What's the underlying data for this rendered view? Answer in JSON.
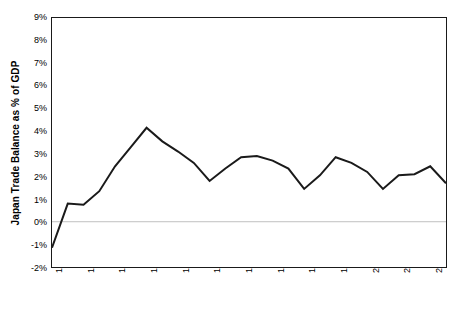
{
  "chart_data": {
    "type": "line",
    "title": "",
    "xlabel": "",
    "ylabel": "Japan Trade Balance as % of GDP",
    "x": [
      1980,
      1981,
      1982,
      1983,
      1984,
      1985,
      1986,
      1987,
      1988,
      1989,
      1990,
      1991,
      1992,
      1993,
      1994,
      1995,
      1996,
      1997,
      1998,
      1999,
      2000,
      2001,
      2002,
      2003,
      2004,
      2005
    ],
    "values": [
      -1.15,
      0.8,
      0.75,
      1.35,
      2.45,
      3.3,
      4.15,
      3.55,
      3.1,
      2.6,
      1.8,
      2.35,
      2.85,
      2.9,
      2.7,
      2.35,
      1.45,
      2.05,
      2.85,
      2.6,
      2.2,
      1.45,
      2.05,
      2.1,
      2.45,
      1.7
    ],
    "series": [
      {
        "name": "Japan Trade Balance as % of GDP",
        "values": [
          -1.15,
          0.8,
          0.75,
          1.35,
          2.45,
          3.3,
          4.15,
          3.55,
          3.1,
          2.6,
          1.8,
          2.35,
          2.85,
          2.9,
          2.7,
          2.35,
          1.45,
          2.05,
          2.85,
          2.6,
          2.2,
          1.45,
          2.05,
          2.1,
          2.45,
          1.7
        ],
        "color": "#1a1a1a"
      }
    ],
    "xlim": [
      1980,
      2005
    ],
    "ylim": [
      -2,
      9
    ],
    "y_ticks": [
      9,
      8,
      7,
      6,
      5,
      4,
      3,
      2,
      1,
      0,
      -1,
      -2
    ],
    "y_tick_labels": [
      "9%",
      "8%",
      "7%",
      "6%",
      "5%",
      "4%",
      "3%",
      "2%",
      "1%",
      "0%",
      "-1%",
      "-2%"
    ],
    "x_ticks": [
      1980,
      1982,
      1984,
      1986,
      1988,
      1990,
      1992,
      1994,
      1996,
      1998,
      2000,
      2002,
      2004
    ],
    "x_tick_labels": [
      "1980",
      "1982",
      "1984",
      "1986",
      "1988",
      "1990",
      "1992",
      "1994",
      "1996",
      "1998",
      "2000",
      "2002",
      "2004"
    ],
    "grid": false,
    "zero_line": true,
    "zero_line_color": "#bfbfbf",
    "legend": "none",
    "line_color": "#1a1a1a",
    "line_width": 2,
    "frame_color": "#1a1a1a",
    "background_color": "#ffffff"
  }
}
